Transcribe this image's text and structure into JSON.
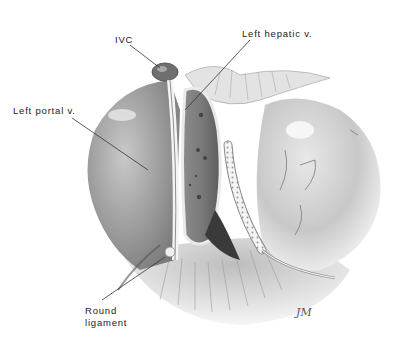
{
  "figure": {
    "type": "anatomical illustration",
    "labels": [
      {
        "id": "ivc",
        "text": "IVC"
      },
      {
        "id": "left_hepatic_v",
        "text": "Left hepatic v."
      },
      {
        "id": "left_portal_v",
        "text": "Left portal v."
      },
      {
        "id": "round_ligament_line1",
        "text": "Round"
      },
      {
        "id": "round_ligament_line2",
        "text": "ligament"
      }
    ],
    "signature": "JM",
    "colors": {
      "background": "#ffffff",
      "ink": "#222222",
      "tissue_light": "#d8d8d8",
      "tissue_dark": "#6a6a6a"
    }
  }
}
